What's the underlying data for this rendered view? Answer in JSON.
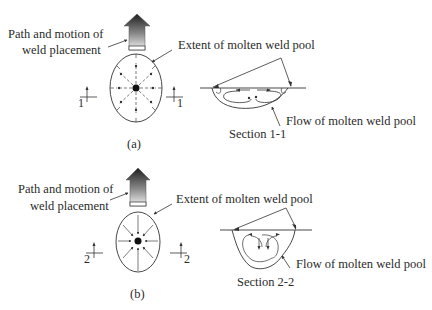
{
  "figure": {
    "panel_a": {
      "caption": "(a)",
      "path_label_line1": "Path and motion of",
      "path_label_line2": "weld placement",
      "extent_label": "Extent of molten weld pool",
      "flow_label": "Flow of molten weld pool",
      "section_label": "Section 1-1",
      "section_marker_left": "1",
      "section_marker_right": "1",
      "flow_direction": "outward"
    },
    "panel_b": {
      "caption": "(b)",
      "path_label_line1": "Path and motion of",
      "path_label_line2": "weld placement",
      "extent_label": "Extent of molten weld pool",
      "flow_label": "Flow of molten weld pool",
      "section_label": "Section 2-2",
      "section_marker_left": "2",
      "section_marker_right": "2",
      "flow_direction": "inward"
    },
    "colors": {
      "line": "#333333",
      "text": "#2a2a2a",
      "arrow_dark": "#222222",
      "arrow_light": "#f2f2f2"
    }
  }
}
